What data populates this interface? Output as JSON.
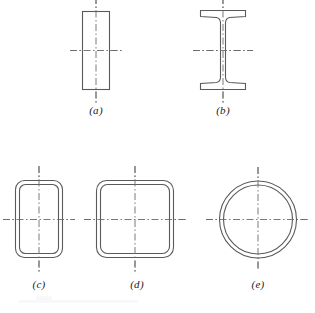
{
  "figure": {
    "background_color": "#ffffff",
    "line_color": "#5a5a5a",
    "centerline_color": "#6b6b6b",
    "width": 315,
    "height": 313
  },
  "shapes": [
    {
      "id": "a",
      "caption": "(a)",
      "name": "solid-rectangle-section",
      "description": "solid rectangular bar cross section",
      "center": {
        "x": 96,
        "y": 50
      },
      "geometry": {
        "x": 82,
        "y": 11,
        "width": 28,
        "height": 79
      },
      "centerline": {
        "vertical_extent": 106,
        "horizontal_extent": 52
      }
    },
    {
      "id": "b",
      "caption": "(b)",
      "name": "i-beam-section",
      "description": "wide flange I-beam cross section with tapered flanges",
      "center": {
        "x": 223,
        "y": 50
      },
      "geometry": {
        "flange_width": 46,
        "flange_thickness": 7,
        "web_thickness": 5,
        "depth": 79,
        "top": 10,
        "bottom": 89,
        "left": 200,
        "right": 246
      },
      "centerline": {
        "vertical_extent": 106,
        "horizontal_extent": 60
      }
    },
    {
      "id": "c",
      "caption": "(c)",
      "name": "rectangular-tube-section",
      "description": "hollow rectangular tube with rounded corners",
      "center": {
        "x": 39,
        "y": 219
      },
      "geometry": {
        "outer": {
          "x": 15,
          "y": 180,
          "width": 48,
          "height": 78,
          "radius": 9
        },
        "wall_thickness": 4
      },
      "centerline": {
        "vertical_extent": 106,
        "horizontal_extent": 72
      }
    },
    {
      "id": "d",
      "caption": "(d)",
      "name": "square-tube-section",
      "description": "hollow square tube with rounded corners",
      "center": {
        "x": 135,
        "y": 219
      },
      "geometry": {
        "outer": {
          "x": 96,
          "y": 180,
          "width": 78,
          "height": 78,
          "radius": 10
        },
        "wall_thickness": 4
      },
      "centerline": {
        "vertical_extent": 106,
        "horizontal_extent": 102
      }
    },
    {
      "id": "e",
      "caption": "(e)",
      "name": "circular-tube-section",
      "description": "hollow circular tube / pipe cross section",
      "center": {
        "x": 258,
        "y": 219
      },
      "geometry": {
        "outer_radius": 39,
        "inner_radius": 35
      },
      "centerline": {
        "vertical_extent": 104,
        "horizontal_extent": 104
      }
    }
  ],
  "captions": {
    "a": "(a)",
    "b": "(b)",
    "c": "(c)",
    "d": "(d)",
    "e": "(e)"
  }
}
